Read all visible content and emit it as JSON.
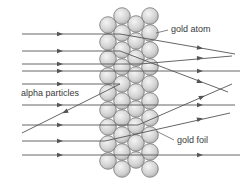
{
  "diagram": {
    "labels": {
      "gold_atom": "gold atom",
      "alpha_particles": "alpha particles",
      "gold_foil": "gold foil"
    },
    "colors": {
      "line": "#555555",
      "atom_fill": "#d2d2d2",
      "atom_stroke": "#666666"
    },
    "atom_columns": [
      {
        "x": 108,
        "y_start": 25,
        "count": 9
      },
      {
        "x": 122,
        "y_start": 16,
        "count": 10
      },
      {
        "x": 136,
        "y_start": 24,
        "count": 9
      },
      {
        "x": 150,
        "y_start": 16,
        "count": 10
      }
    ],
    "paths": [
      {
        "points": [
          [
            22,
            34
          ],
          [
            120,
            34
          ],
          [
            235,
            54
          ]
        ],
        "arrows": [
          [
            60,
            34
          ],
          [
            200,
            48
          ]
        ]
      },
      {
        "points": [
          [
            22,
            51
          ],
          [
            120,
            51
          ],
          [
            228,
            92
          ]
        ],
        "arrows": [
          [
            60,
            51
          ],
          [
            200,
            82
          ]
        ]
      },
      {
        "points": [
          [
            22,
            64
          ],
          [
            140,
            64
          ],
          [
            232,
            56
          ]
        ],
        "arrows": [
          [
            60,
            64
          ],
          [
            200,
            58
          ]
        ]
      },
      {
        "points": [
          [
            22,
            71
          ],
          [
            240,
            71
          ]
        ],
        "arrows": [
          [
            60,
            71
          ],
          [
            200,
            71
          ]
        ]
      },
      {
        "points": [
          [
            22,
            84
          ],
          [
            120,
            84
          ],
          [
            22,
            133
          ]
        ],
        "arrows": [
          [
            60,
            84
          ],
          [
            65,
            112
          ]
        ]
      },
      {
        "points": [
          [
            22,
            105
          ],
          [
            235,
            105
          ]
        ],
        "arrows": [
          [
            60,
            105
          ],
          [
            200,
            105
          ]
        ]
      },
      {
        "points": [
          [
            22,
            125
          ],
          [
            138,
            125
          ],
          [
            232,
            84
          ]
        ],
        "arrows": [
          [
            60,
            125
          ],
          [
            202,
            97
          ]
        ]
      },
      {
        "points": [
          [
            22,
            141
          ],
          [
            105,
            141
          ],
          [
            230,
            113
          ]
        ],
        "arrows": [
          [
            60,
            141
          ],
          [
            200,
            119
          ]
        ]
      },
      {
        "points": [
          [
            22,
            155
          ],
          [
            240,
            155
          ]
        ],
        "arrows": [
          [
            60,
            155
          ],
          [
            200,
            155
          ]
        ]
      }
    ]
  }
}
